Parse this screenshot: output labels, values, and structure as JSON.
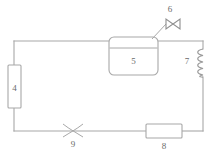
{
  "diagram": {
    "background_color": "#ffffff",
    "line_color": "#a8a8a8",
    "label_color": "#6b6b6b",
    "components": [
      {
        "id": "4",
        "label": "4",
        "type": "vertical-rectangle-component",
        "name": "component-4-evaporator"
      },
      {
        "id": "5",
        "label": "5",
        "type": "tank-with-level-line",
        "name": "component-5-tank"
      },
      {
        "id": "6",
        "label": "6",
        "type": "butterfly-valve",
        "name": "component-6-valve"
      },
      {
        "id": "7",
        "label": "7",
        "type": "coil-helix",
        "name": "component-7-coil"
      },
      {
        "id": "8",
        "label": "8",
        "type": "horizontal-rectangle-component",
        "name": "component-8-compressor"
      },
      {
        "id": "9",
        "label": "9",
        "type": "expansion-valve-cross",
        "name": "component-9-expansion-valve"
      }
    ]
  }
}
